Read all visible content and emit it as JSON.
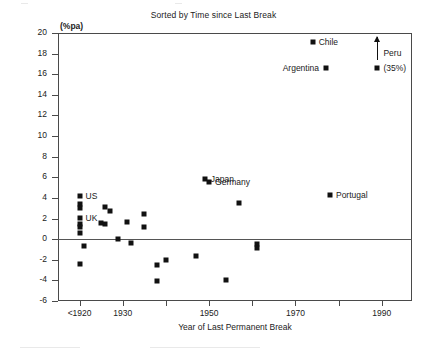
{
  "chart_data": {
    "type": "scatter",
    "title": "Sorted by Time since Last Break",
    "xlabel": "Year of Last Permanent Break",
    "ylabel": "(%pa)",
    "yunit": "(%pa)",
    "xlim": [
      1915,
      1997
    ],
    "ylim": [
      -6,
      20
    ],
    "ytick_step": 2,
    "grid": false,
    "legend": "none",
    "zero_line": 0,
    "yticks": [
      "20",
      "18",
      "16",
      "14",
      "12",
      "10",
      "8",
      "6",
      "4",
      "2",
      "0",
      "-2",
      "-4",
      "-6"
    ],
    "ytick_values": [
      20,
      18,
      16,
      14,
      12,
      10,
      8,
      6,
      4,
      2,
      0,
      -2,
      -4,
      -6
    ],
    "xticks": [
      {
        "value": 1920,
        "label": "<1920"
      },
      {
        "value": 1930,
        "label": "1930"
      },
      {
        "value": 1940,
        "label": ""
      },
      {
        "value": 1950,
        "label": "1950"
      },
      {
        "value": 1960,
        "label": ""
      },
      {
        "value": 1970,
        "label": "1970"
      },
      {
        "value": 1980,
        "label": ""
      },
      {
        "value": 1990,
        "label": "1990"
      }
    ],
    "points": [
      {
        "x": 1920,
        "y": 4.2,
        "label": "US"
      },
      {
        "x": 1920,
        "y": 3.4,
        "label": ""
      },
      {
        "x": 1920,
        "y": 3.0,
        "label": ""
      },
      {
        "x": 1920,
        "y": 2.1,
        "label": "UK"
      },
      {
        "x": 1920,
        "y": 1.5,
        "label": ""
      },
      {
        "x": 1920,
        "y": 1.2,
        "label": ""
      },
      {
        "x": 1920,
        "y": 0.6,
        "label": ""
      },
      {
        "x": 1920,
        "y": -2.4,
        "label": ""
      },
      {
        "x": 1921,
        "y": -0.7,
        "label": ""
      },
      {
        "x": 1926,
        "y": 3.1,
        "label": ""
      },
      {
        "x": 1925,
        "y": 1.55,
        "label": ""
      },
      {
        "x": 1926,
        "y": 1.5,
        "label": ""
      },
      {
        "x": 1927,
        "y": 2.7,
        "label": ""
      },
      {
        "x": 1929,
        "y": 0.05,
        "label": ""
      },
      {
        "x": 1931,
        "y": 1.65,
        "label": ""
      },
      {
        "x": 1932,
        "y": -0.35,
        "label": ""
      },
      {
        "x": 1935,
        "y": 2.45,
        "label": ""
      },
      {
        "x": 1935,
        "y": 1.2,
        "label": ""
      },
      {
        "x": 1938,
        "y": -2.55,
        "label": ""
      },
      {
        "x": 1938,
        "y": -4.1,
        "label": ""
      },
      {
        "x": 1940,
        "y": -2.0,
        "label": ""
      },
      {
        "x": 1947,
        "y": -1.65,
        "label": ""
      },
      {
        "x": 1949,
        "y": 5.85,
        "label": "Japan"
      },
      {
        "x": 1950,
        "y": 5.5,
        "label": "Germany"
      },
      {
        "x": 1954,
        "y": -4.0,
        "label": ""
      },
      {
        "x": 1957,
        "y": 3.55,
        "label": ""
      },
      {
        "x": 1961,
        "y": -0.5,
        "label": ""
      },
      {
        "x": 1961,
        "y": -0.85,
        "label": ""
      },
      {
        "x": 1974,
        "y": 19.1,
        "label": "Chile"
      },
      {
        "x": 1977,
        "y": 16.6,
        "label": "Argentina"
      },
      {
        "x": 1978,
        "y": 4.3,
        "label": "Portugal"
      },
      {
        "x": 1989,
        "y": 16.6,
        "label": "Peru"
      }
    ],
    "annotations": [
      {
        "text": "US",
        "x": 1920,
        "y": 4.2,
        "side": "right"
      },
      {
        "text": "UK",
        "x": 1920,
        "y": 2.1,
        "side": "right"
      },
      {
        "text": "Japan",
        "x": 1949,
        "y": 5.85,
        "side": "right"
      },
      {
        "text": "Germany",
        "x": 1950,
        "y": 5.5,
        "side": "right"
      },
      {
        "text": "Portugal",
        "x": 1978,
        "y": 4.3,
        "side": "right"
      },
      {
        "text": "Chile",
        "x": 1974,
        "y": 19.1,
        "side": "right"
      },
      {
        "text": "Argentina",
        "x": 1977,
        "y": 16.6,
        "side": "left"
      },
      {
        "text": "Peru",
        "x": 1989,
        "y": 18.1,
        "side": "right"
      },
      {
        "text": "(35%)",
        "x": 1989,
        "y": 16.6,
        "side": "right"
      }
    ],
    "special_markers": [
      {
        "name": "peru-off-scale-arrow",
        "x": 1989,
        "y_from": 17.4,
        "y_to": 19.6,
        "note": "upward arrow indicating Peru value of 35% is off scale"
      }
    ]
  }
}
